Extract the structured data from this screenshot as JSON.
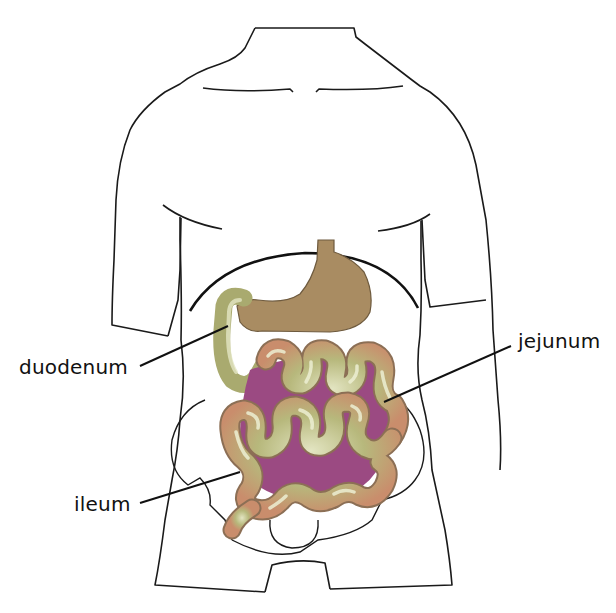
{
  "diagram": {
    "labels": [
      {
        "id": "duodenum",
        "text": "duodenum"
      },
      {
        "id": "jejunum",
        "text": "jejunum"
      },
      {
        "id": "ileum",
        "text": "ileum"
      }
    ],
    "parts": [
      "body-outline",
      "stomach",
      "diaphragm",
      "pelvis",
      "duodenum",
      "jejunum",
      "ileum"
    ],
    "colors": {
      "outline": "#1a1a1a",
      "stomach": "#a98c62",
      "intestine": "#b5b67a",
      "intestine_highlight": "#e6e8c8",
      "intestine_shadow": "#c78a6a",
      "mesentery": "#9b4a82",
      "background": "#ffffff"
    }
  }
}
